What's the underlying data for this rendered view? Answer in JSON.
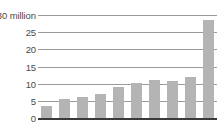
{
  "chart_data": {
    "type": "bar",
    "title": "",
    "xlabel": "",
    "ylabel": "",
    "unit_label": "$30 million",
    "categories": [
      "1",
      "2",
      "3",
      "4",
      "5",
      "6",
      "7",
      "8",
      "9",
      "10"
    ],
    "values": [
      3.5,
      5.5,
      6.0,
      7.0,
      9.0,
      10.2,
      11.2,
      10.8,
      12.0,
      28.5
    ],
    "ylim": [
      0,
      30
    ],
    "yticks": [
      0,
      5,
      10,
      15,
      20,
      25,
      30
    ],
    "ytick_labels": [
      "0",
      "5",
      "10",
      "15",
      "20",
      "25",
      "$30 million"
    ],
    "grid": true,
    "legend": "none",
    "bar_color": "#b4b4b4",
    "gridline_color": "#9a9a9a",
    "axis_color": "#3a3a3a",
    "text_color": "#4a4a4a",
    "background_color": "#ffffff"
  }
}
